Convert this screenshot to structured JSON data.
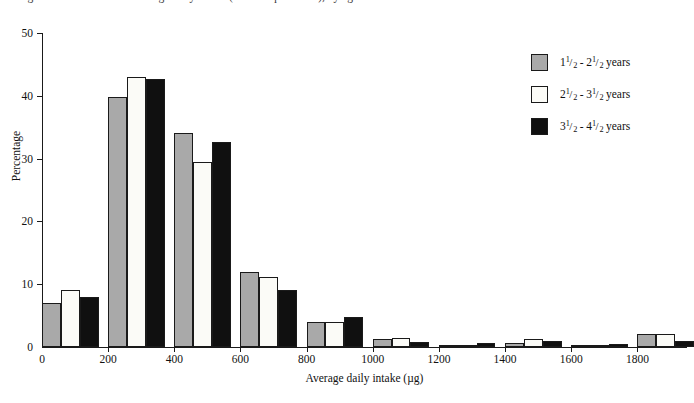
{
  "caption": {
    "text": "Figure 1: Distribution of average daily intake (retinol equivalents), by age of child"
  },
  "chart_data": {
    "type": "bar",
    "title": "",
    "subtitle": "",
    "xlabel": "Average daily intake (µg)",
    "ylabel": "Percentage",
    "grid": false,
    "legend_position": "right",
    "xlim": [
      0,
      1950
    ],
    "ylim": [
      0,
      50
    ],
    "xticks": [
      0,
      200,
      400,
      600,
      800,
      1000,
      1200,
      1400,
      1600,
      1800
    ],
    "yticks": [
      0,
      10,
      20,
      30,
      40,
      50
    ],
    "bin_width": 200,
    "categories": [
      "0-200",
      "200-400",
      "400-600",
      "600-800",
      "800-1000",
      "1000-1200",
      "1200-1400",
      "1400-1600",
      "1600-1800",
      "1800-2000"
    ],
    "bin_starts": [
      0,
      200,
      400,
      600,
      800,
      1000,
      1200,
      1400,
      1600,
      1800
    ],
    "series": [
      {
        "name": "1 1/2 - 2 1/2 years",
        "color": "#a9a9a9",
        "values": [
          7.0,
          39.8,
          34.1,
          12.0,
          4.0,
          1.3,
          0.3,
          0.6,
          0.1,
          2.1
        ]
      },
      {
        "name": "2 1/2 - 3 1/2 years",
        "color": "#fbfbf7",
        "values": [
          9.0,
          43.0,
          29.4,
          11.1,
          4.0,
          1.5,
          0.2,
          1.2,
          0.1,
          2.1
        ]
      },
      {
        "name": "3 1/2 - 4 1/2 years",
        "color": "#101010",
        "values": [
          8.0,
          42.7,
          32.6,
          9.0,
          4.7,
          0.8,
          0.7,
          1.0,
          0.5,
          1.0
        ]
      }
    ]
  },
  "legend": {
    "items": [
      {
        "swatch": "gray-swatch",
        "whole1": "1",
        "num1": "1",
        "den1": "2",
        "dash": " - ",
        "whole2": "2",
        "num2": "1",
        "den2": "2",
        "unit": " years"
      },
      {
        "swatch": "white-swatch",
        "whole1": "2",
        "num1": "1",
        "den1": "2",
        "dash": " - ",
        "whole2": "3",
        "num2": "1",
        "den2": "2",
        "unit": " years"
      },
      {
        "swatch": "black-swatch",
        "whole1": "3",
        "num1": "1",
        "den1": "2",
        "dash": " - ",
        "whole2": "4",
        "num2": "1",
        "den2": "2",
        "unit": " years"
      }
    ]
  },
  "colors": {
    "series1": "#a9a9a9",
    "series2": "#fbfbf7",
    "series3": "#101010",
    "axis": "#1a1a1a",
    "background": "#ffffff"
  }
}
